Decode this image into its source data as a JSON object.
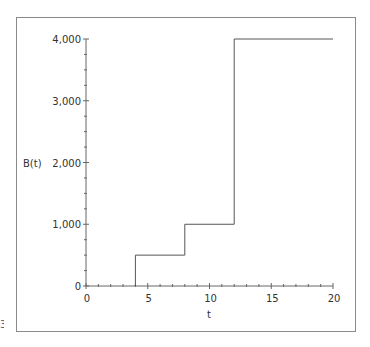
{
  "chart_data": {
    "type": "line",
    "subtype": "step",
    "title": "",
    "xlabel": "t",
    "ylabel": "B(t)",
    "xlim": [
      0,
      20
    ],
    "ylim": [
      0,
      4000
    ],
    "x_ticks": [
      0,
      5,
      10,
      15,
      20
    ],
    "x_tick_labels": [
      "0",
      "5",
      "10",
      "15",
      "20"
    ],
    "x_minor_step": 1,
    "y_ticks": [
      0,
      1000,
      2000,
      3000,
      4000
    ],
    "y_tick_labels": [
      "0",
      "1,000",
      "2,000",
      "3,000",
      "4,000"
    ],
    "y_minor_step": 250,
    "grid": false,
    "legend": "none",
    "series": [
      {
        "name": "B(t)",
        "points": [
          [
            4,
            0
          ],
          [
            4,
            500
          ],
          [
            8,
            500
          ],
          [
            8,
            1000
          ],
          [
            12,
            1000
          ],
          [
            12,
            4000
          ],
          [
            20,
            4000
          ]
        ]
      }
    ],
    "colors": {
      "line": "#555555",
      "axis": "#666666",
      "frame": "#8a8a8a"
    }
  },
  "edge_mark": "3"
}
